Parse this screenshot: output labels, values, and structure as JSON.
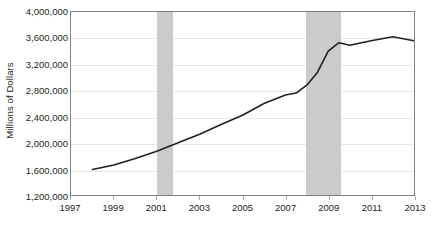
{
  "chart_data": {
    "type": "line",
    "title": "",
    "subtitle": "",
    "xlabel": "",
    "ylabel": "Millions of Dollars",
    "xlim": [
      1997,
      2013
    ],
    "ylim": [
      1200000,
      4000000
    ],
    "grid": true,
    "legend": null,
    "y_ticks": [
      "1,200,000",
      "1,600,000",
      "2,000,000",
      "2,400,000",
      "2,800,000",
      "3,200,000",
      "3,600,000",
      "4,000,000"
    ],
    "y_tick_values": [
      1200000,
      1600000,
      2000000,
      2400000,
      2800000,
      3200000,
      3600000,
      4000000
    ],
    "x_ticks": [
      "1997",
      "1999",
      "2001",
      "2003",
      "2005",
      "2007",
      "2009",
      "2011",
      "2013"
    ],
    "x_tick_values": [
      1997,
      1999,
      2001,
      2003,
      2005,
      2007,
      2009,
      2011,
      2013
    ],
    "series": [
      {
        "name": "Millions of Dollars",
        "color": "#231f20",
        "x": [
          1998.0,
          1999.0,
          2000.0,
          2001.0,
          2002.0,
          2003.0,
          2004.0,
          2005.0,
          2006.0,
          2007.0,
          2007.5,
          2008.0,
          2008.5,
          2009.0,
          2009.5,
          2010.0,
          2011.0,
          2012.0,
          2013.0
        ],
        "values": [
          1590000,
          1660000,
          1760000,
          1870000,
          2000000,
          2130000,
          2280000,
          2420000,
          2600000,
          2730000,
          2760000,
          2880000,
          3080000,
          3400000,
          3530000,
          3490000,
          3560000,
          3620000,
          3560000
        ]
      }
    ],
    "shaded_regions": [
      {
        "name": "recession-2001",
        "x_start": 2001.0,
        "x_end": 2001.75,
        "color": "#cbcbcb"
      },
      {
        "name": "recession-2008",
        "x_start": 2007.9,
        "x_end": 2009.5,
        "color": "#cbcbcb"
      }
    ]
  }
}
